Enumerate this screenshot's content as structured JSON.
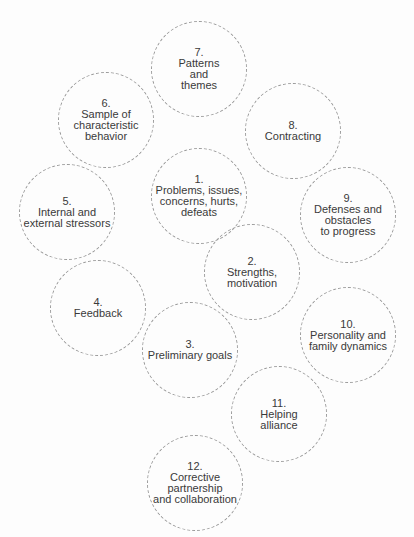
{
  "diagram": {
    "type": "bubble-cluster",
    "nodes": [
      {
        "id": 7,
        "number": "7.",
        "lines": [
          "Patterns",
          "and",
          "themes"
        ],
        "cx": 199,
        "cy": 69
      },
      {
        "id": 6,
        "number": "6.",
        "lines": [
          "Sample of",
          "characteristic",
          "behavior"
        ],
        "cx": 106,
        "cy": 120
      },
      {
        "id": 8,
        "number": "8.",
        "lines": [
          "Contracting"
        ],
        "cx": 293,
        "cy": 131
      },
      {
        "id": 1,
        "number": "1.",
        "lines": [
          "Problems, issues,",
          "concerns, hurts,",
          "defeats"
        ],
        "cx": 199,
        "cy": 196
      },
      {
        "id": 5,
        "number": "5.",
        "lines": [
          "Internal and",
          "external stressors"
        ],
        "cx": 67,
        "cy": 212
      },
      {
        "id": 9,
        "number": "9.",
        "lines": [
          "Defenses and",
          "obstacles",
          "to progress"
        ],
        "cx": 348,
        "cy": 215
      },
      {
        "id": 2,
        "number": "2.",
        "lines": [
          "Strengths,",
          "motivation"
        ],
        "cx": 252,
        "cy": 272
      },
      {
        "id": 4,
        "number": "4.",
        "lines": [
          "Feedback"
        ],
        "cx": 98,
        "cy": 308
      },
      {
        "id": 10,
        "number": "10.",
        "lines": [
          "Personality and",
          "family dynamics"
        ],
        "cx": 348,
        "cy": 335
      },
      {
        "id": 3,
        "number": "3.",
        "lines": [
          "Preliminary goals"
        ],
        "cx": 190,
        "cy": 350
      },
      {
        "id": 11,
        "number": "11.",
        "lines": [
          "Helping",
          "alliance"
        ],
        "cx": 279,
        "cy": 414
      },
      {
        "id": 12,
        "number": "12.",
        "lines": [
          "Corrective",
          "partnership",
          "and collaboration"
        ],
        "cx": 195,
        "cy": 483
      }
    ]
  }
}
